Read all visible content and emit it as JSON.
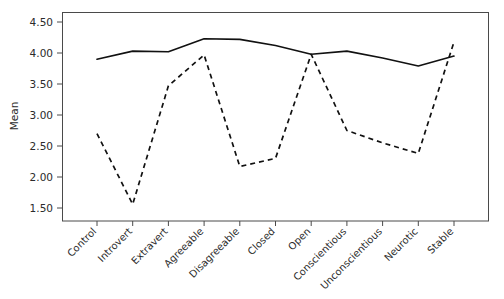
{
  "chart_data": {
    "type": "line",
    "title": "",
    "xlabel": "",
    "ylabel": "Mean",
    "ylim": [
      1.35,
      4.62
    ],
    "yticks": [
      1.5,
      2.0,
      2.5,
      3.0,
      3.5,
      4.0,
      4.5
    ],
    "ytick_labels": [
      "1.50",
      "2.00",
      "2.50",
      "3.00",
      "3.50",
      "4.00",
      "4.50"
    ],
    "grid": false,
    "legend": "none",
    "xtick_rotation_deg": -45,
    "categories": [
      "Control",
      "Introvert",
      "Extravert",
      "Agreeable",
      "Disagreeable",
      "Closed",
      "Open",
      "Conscientious",
      "Unconscientious",
      "Neurotic",
      "Stable"
    ],
    "series": [
      {
        "name": "solid-series",
        "style": "solid",
        "color": "#111111",
        "values": [
          3.9,
          4.03,
          4.02,
          4.23,
          4.22,
          4.12,
          3.98,
          4.03,
          3.92,
          3.79,
          3.95
        ]
      },
      {
        "name": "dashed-series",
        "style": "dashed",
        "color": "#111111",
        "values": [
          2.7,
          1.56,
          3.47,
          3.97,
          2.17,
          2.3,
          3.98,
          2.75,
          2.55,
          2.38,
          4.18
        ]
      }
    ]
  },
  "colors": {
    "background": "#ffffff",
    "frame": "#4a4a4a",
    "ink": "#111111",
    "text": "#2b2b2b"
  },
  "plot_box": {
    "left": 62,
    "top": 12,
    "right": 489,
    "bottom": 221
  }
}
